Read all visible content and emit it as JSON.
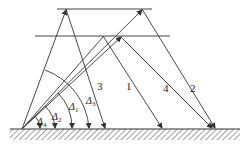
{
  "diagram": {
    "title": "",
    "layers": {
      "upper_layer_line": {
        "y": 9,
        "x1": 57,
        "x2": 152
      },
      "lower_layer_line": {
        "y": 36,
        "x1": 35,
        "x2": 170
      },
      "ground": {
        "y": 129,
        "x1": 10,
        "x2": 240
      }
    },
    "origin": {
      "x": 22,
      "y": 129
    },
    "rays": [
      {
        "label": "3",
        "label_pos": [
          97,
          88
        ],
        "up": [
          22,
          129,
          66,
          9
        ],
        "down": [
          66,
          9,
          105,
          129
        ]
      },
      {
        "label": "1",
        "label_pos": [
          126,
          88
        ],
        "up": [
          22,
          129,
          103,
          36
        ],
        "down": [
          103,
          36,
          162,
          129
        ]
      },
      {
        "label": "4",
        "label_pos": [
          163,
          90
        ],
        "up": [
          22,
          129,
          120,
          38
        ],
        "down": [
          120,
          38,
          212,
          129
        ]
      },
      {
        "label": "2",
        "label_pos": [
          190,
          90
        ],
        "up": [
          22,
          129,
          143,
          9
        ],
        "down": [
          143,
          9,
          215,
          129
        ]
      }
    ],
    "angles": [
      {
        "label": "Δ",
        "sub": "1",
        "pos": [
          73,
          108
        ],
        "r": 50
      },
      {
        "label": "Δ",
        "sub": "2",
        "pos": [
          56,
          118
        ],
        "r": 33
      },
      {
        "label": "Δ",
        "sub": "3",
        "pos": [
          89,
          104
        ],
        "r": 67
      },
      {
        "label": "Δ",
        "sub": "4",
        "pos": [
          41,
          124
        ],
        "r": 18
      }
    ],
    "colors": {
      "line": "#333333",
      "background": "#ffffff"
    }
  }
}
